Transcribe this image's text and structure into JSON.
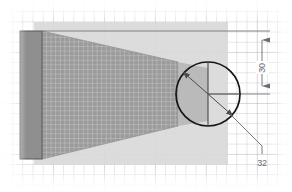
{
  "drawing": {
    "title": "Tapered meshed solid with circular boss",
    "canvas": {
      "width": 292,
      "height": 192,
      "background_color": "#ffffff"
    },
    "background": {
      "name": "graph-paper-grid",
      "minor_spacing_px": 10,
      "major_spacing_px": 51,
      "line_color": "#aaaab4"
    },
    "shapes": {
      "footprint_plate": {
        "label": "light background plate",
        "fill_color": "#d8d8d8",
        "x": 34,
        "y": 22,
        "width": 194,
        "height": 143
      },
      "end_block": {
        "label": "left end block",
        "fill_color": "#8f8f8f",
        "stroke_color": "#5a5a5a",
        "x": 20,
        "y": 31,
        "width": 22,
        "height": 128
      },
      "tapered_mesh_body": {
        "label": "tapered meshed body",
        "fill_color": "#9a9a9a",
        "mesh_line_color": "#c9c9c9",
        "mesh_cell_px": 4.6,
        "points": "42,31 178,62 178,126 42,159"
      },
      "circle_boss": {
        "label": "circular boss",
        "center_x": 208,
        "center_y": 94,
        "radius": 32,
        "stroke_color": "#1a1a1a",
        "stroke_width": 1.6,
        "fill_color": "none"
      }
    },
    "annotations": {
      "vertical_dimension": {
        "name": "height-dimension",
        "value": "30",
        "line_x": 262,
        "from_y": 32,
        "to_y": 95,
        "stroke_color": "#6b6b72",
        "text_x": 262,
        "text_y": 68
      },
      "diameter_dimension": {
        "name": "diameter-dimension",
        "value": "32",
        "stroke_color": "#6b6b72",
        "leader": "235,120 262,148 262,155",
        "text_x": 262,
        "text_y": 164
      },
      "extension_lines": [
        {
          "name": "top-extension-line",
          "x1": 42,
          "y1": 31,
          "x2": 268,
          "y2": 31
        },
        {
          "name": "center-extension-line",
          "x1": 208,
          "y1": 94,
          "x2": 268,
          "y2": 94
        }
      ],
      "center_marks": [
        {
          "name": "vertical-centerline",
          "x1": 208,
          "y1": 62,
          "x2": 208,
          "y2": 126
        },
        {
          "name": "horizontal-centerline",
          "x1": 208,
          "y1": 94,
          "x2": 240,
          "y2": 94
        }
      ],
      "diameter_line": {
        "name": "diameter-leader-line",
        "x1": 182,
        "y1": 72,
        "x2": 234,
        "y2": 117
      }
    }
  }
}
